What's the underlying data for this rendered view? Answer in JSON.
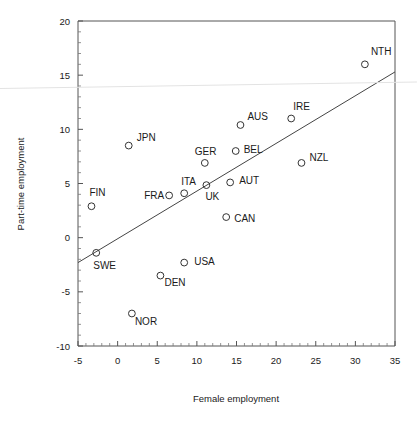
{
  "chart_data": {
    "type": "scatter",
    "title": "",
    "xlabel": "Female employment",
    "ylabel": "Part-time employment",
    "xlim": [
      -5,
      35
    ],
    "ylim": [
      -10,
      20
    ],
    "xticks": [
      -5,
      0,
      5,
      10,
      15,
      20,
      25,
      30,
      35
    ],
    "yticks": [
      -10,
      -5,
      0,
      5,
      10,
      15,
      20
    ],
    "xtick_labels": [
      "-5",
      "0",
      "5",
      "10",
      "15",
      "20",
      "25",
      "30",
      "35"
    ],
    "ytick_labels": [
      "-10",
      "-5",
      "0",
      "5",
      "10",
      "15",
      "20"
    ],
    "grid": false,
    "legend": false,
    "minor_ticks": true,
    "points": [
      {
        "label": "NTH",
        "x": 31.2,
        "y": 16.0,
        "label_dx": 6,
        "label_dy": -9
      },
      {
        "label": "IRE",
        "x": 21.9,
        "y": 11.0,
        "label_dx": 2,
        "label_dy": -9
      },
      {
        "label": "AUS",
        "x": 15.5,
        "y": 10.4,
        "label_dx": 7,
        "label_dy": -5
      },
      {
        "label": "JPN",
        "x": 1.4,
        "y": 8.5,
        "label_dx": 8,
        "label_dy": -5
      },
      {
        "label": "BEL",
        "x": 14.9,
        "y": 8.0,
        "label_dx": 8,
        "label_dy": 2
      },
      {
        "label": "GER",
        "x": 11.0,
        "y": 6.9,
        "label_dx": -10,
        "label_dy": -8
      },
      {
        "label": "NZL",
        "x": 23.2,
        "y": 6.9,
        "label_dx": 8,
        "label_dy": -2
      },
      {
        "label": "AUT",
        "x": 14.2,
        "y": 5.1,
        "label_dx": 9,
        "label_dy": 2
      },
      {
        "label": "UK",
        "x": 11.2,
        "y": 4.85,
        "label_dx": -1,
        "label_dy": 15
      },
      {
        "label": "ITA",
        "x": 8.4,
        "y": 4.1,
        "label_dx": -3,
        "label_dy": -8
      },
      {
        "label": "FRA",
        "x": 6.5,
        "y": 3.9,
        "label_dx": -25,
        "label_dy": 4
      },
      {
        "label": "FIN",
        "x": -3.3,
        "y": 2.9,
        "label_dx": -2,
        "label_dy": -10
      },
      {
        "label": "CAN",
        "x": 13.7,
        "y": 1.9,
        "label_dx": 8,
        "label_dy": 5
      },
      {
        "label": "SWE",
        "x": -2.7,
        "y": -1.4,
        "label_dx": -3,
        "label_dy": 16
      },
      {
        "label": "USA",
        "x": 8.4,
        "y": -2.3,
        "label_dx": 10,
        "label_dy": 2
      },
      {
        "label": "DEN",
        "x": 5.4,
        "y": -3.5,
        "label_dx": 4,
        "label_dy": 10
      },
      {
        "label": "NOR",
        "x": 1.8,
        "y": -7.0,
        "label_dx": 3,
        "label_dy": 11
      }
    ],
    "fit_line": {
      "x_start": -5,
      "y_start": -2.3,
      "x_end": 35,
      "y_end": 15.3
    }
  }
}
